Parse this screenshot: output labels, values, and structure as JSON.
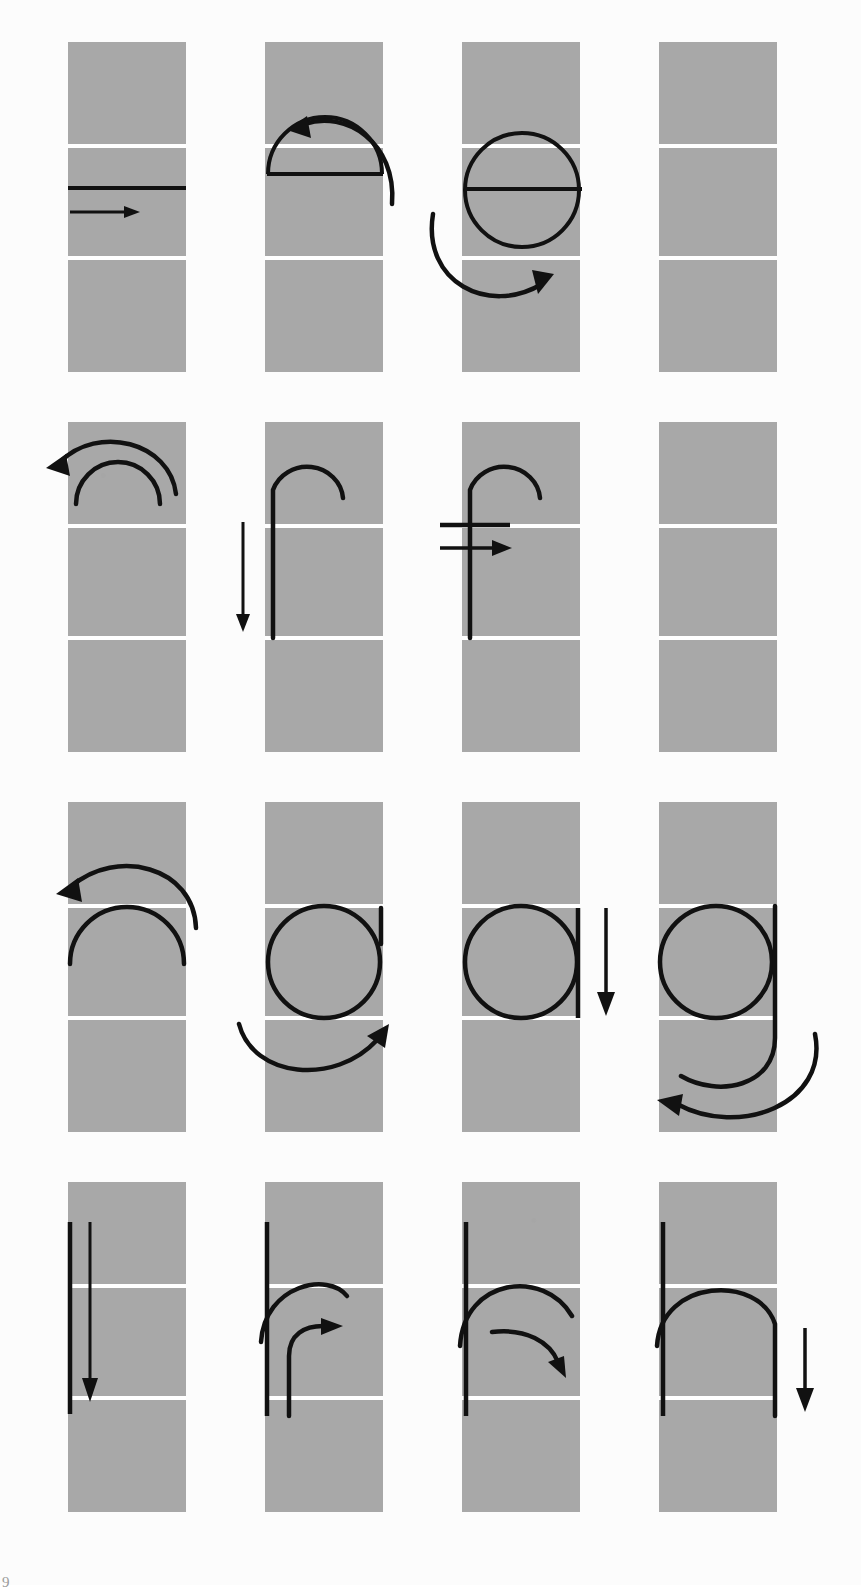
{
  "figure": {
    "page_number": "9",
    "grid": {
      "rows": 4,
      "cols": 4
    },
    "colors": {
      "page_background": "#fcfcfc",
      "panel_fill": "#a8a8a8",
      "guide_line": "#ffffff",
      "stroke": "#111111",
      "page_number": "#9a9a9a"
    },
    "geometry": {
      "panel_width": 118,
      "panel_height": 330,
      "col_x": [
        68,
        265,
        462,
        659
      ],
      "row_y": [
        42,
        422,
        802,
        1182
      ],
      "guide_offsets": [
        104,
        216
      ]
    }
  },
  "panels": [
    {
      "id": "r1c1",
      "row": 1,
      "col": 1,
      "label": "horizontal-bar-stroke",
      "letter_stage": "crossbar",
      "elements": [
        "horizontal baseline stroke",
        "straight right arrow"
      ],
      "arrow": {
        "type": "straight",
        "direction": "right"
      }
    },
    {
      "id": "r1c2",
      "row": 1,
      "col": 2,
      "label": "arch-on-bar",
      "letter_stage": "half-disc arch over bar",
      "elements": [
        "semicircular arch outline",
        "horizontal bar",
        "curved arrow"
      ],
      "arrow": {
        "type": "curved",
        "direction": "counter-clockwise-left"
      }
    },
    {
      "id": "r1c3",
      "row": 1,
      "col": 3,
      "label": "closed-bowl-with-bar",
      "letter_stage": "letter e bowl closed",
      "elements": [
        "full circle outline",
        "horizontal crossbar",
        "curved arrow"
      ],
      "arrow": {
        "type": "curved",
        "direction": "clockwise-right"
      }
    },
    {
      "id": "r1c4",
      "row": 1,
      "col": 4,
      "label": "empty-panel",
      "letter_stage": "blank",
      "elements": [],
      "arrow": null
    },
    {
      "id": "r2c1",
      "row": 2,
      "col": 1,
      "label": "double-arch",
      "letter_stage": "hook head",
      "elements": [
        "inner arc",
        "outer curved arrow"
      ],
      "arrow": {
        "type": "curved",
        "direction": "counter-clockwise-left"
      }
    },
    {
      "id": "r2c2",
      "row": 2,
      "col": 2,
      "label": "hook-and-stem",
      "letter_stage": "letter f stem",
      "elements": [
        "hook arc",
        "vertical stem",
        "straight down arrow"
      ],
      "arrow": {
        "type": "straight",
        "direction": "down"
      }
    },
    {
      "id": "r2c3",
      "row": 2,
      "col": 3,
      "label": "letter-f-complete",
      "letter_stage": "letter f with crossbar",
      "elements": [
        "hook arc",
        "vertical stem",
        "crossbar",
        "straight right arrow"
      ],
      "arrow": {
        "type": "straight",
        "direction": "right"
      }
    },
    {
      "id": "r2c4",
      "row": 2,
      "col": 4,
      "label": "empty-panel",
      "letter_stage": "blank",
      "elements": [],
      "arrow": null
    },
    {
      "id": "r3c1",
      "row": 3,
      "col": 1,
      "label": "wide-double-arch",
      "letter_stage": "bowl start",
      "elements": [
        "inner wide arc",
        "outer curved arrow"
      ],
      "arrow": {
        "type": "curved",
        "direction": "counter-clockwise-left"
      }
    },
    {
      "id": "r3c2",
      "row": 3,
      "col": 2,
      "label": "bowl-with-right-stem",
      "letter_stage": "letter g bowl",
      "elements": [
        "circle bowl",
        "short right stem",
        "curved arrow"
      ],
      "arrow": {
        "type": "curved",
        "direction": "clockwise-up-right"
      }
    },
    {
      "id": "r3c3",
      "row": 3,
      "col": 3,
      "label": "bowl-with-full-stem",
      "letter_stage": "letter g bowl and stem",
      "elements": [
        "circle bowl",
        "vertical right stem",
        "straight down arrow"
      ],
      "arrow": {
        "type": "straight",
        "direction": "down"
      }
    },
    {
      "id": "r3c4",
      "row": 3,
      "col": 4,
      "label": "letter-g-complete",
      "letter_stage": "letter g with descender tail",
      "elements": [
        "circle bowl",
        "stem",
        "descender tail",
        "large curved arrow"
      ],
      "arrow": {
        "type": "curved",
        "direction": "counter-clockwise-left"
      }
    },
    {
      "id": "r4c1",
      "row": 4,
      "col": 1,
      "label": "vertical-stem",
      "letter_stage": "letter n stem",
      "elements": [
        "vertical stem",
        "straight down arrow"
      ],
      "arrow": {
        "type": "straight",
        "direction": "down"
      }
    },
    {
      "id": "r4c2",
      "row": 4,
      "col": 2,
      "label": "stem-with-shoulder-start",
      "letter_stage": "letter n shoulder begins",
      "elements": [
        "vertical stem",
        "shoulder arc",
        "curved arrow"
      ],
      "arrow": {
        "type": "curved",
        "direction": "clockwise-up-right"
      }
    },
    {
      "id": "r4c3",
      "row": 4,
      "col": 3,
      "label": "stem-with-shoulder-arc",
      "letter_stage": "letter n shoulder over",
      "elements": [
        "vertical stem",
        "shoulder arc",
        "curved arrow"
      ],
      "arrow": {
        "type": "curved",
        "direction": "clockwise-down-right"
      }
    },
    {
      "id": "r4c4",
      "row": 4,
      "col": 4,
      "label": "letter-n-complete",
      "letter_stage": "letter n finished",
      "elements": [
        "vertical stem",
        "shoulder arc",
        "right leg",
        "straight down arrow"
      ],
      "arrow": {
        "type": "straight",
        "direction": "down"
      }
    }
  ]
}
